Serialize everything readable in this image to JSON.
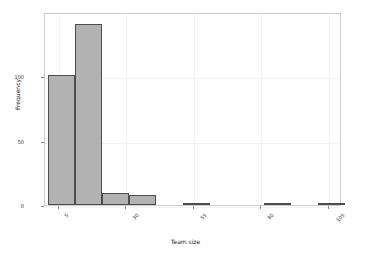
{
  "chart_data": {
    "type": "bar",
    "title": "",
    "xlabel": "Team size",
    "ylabel": "Frequency",
    "grid": true,
    "legend": null,
    "xlim": [
      0,
      110
    ],
    "ylim": [
      0,
      150
    ],
    "yticks": [
      0,
      50,
      100
    ],
    "ytick_labels": [
      "0",
      "50",
      "100"
    ],
    "xticks": [
      5,
      30,
      55,
      80,
      105
    ],
    "xtick_labels": [
      "5",
      "30",
      "55",
      "80",
      "105"
    ],
    "xtick_rotation": -45,
    "bin_edges": [
      1,
      11,
      21,
      31,
      41,
      51,
      61,
      71,
      81,
      91,
      101,
      111
    ],
    "categories": [
      "1-11",
      "11-21",
      "21-31",
      "31-41",
      "41-51",
      "51-61",
      "61-71",
      "71-81",
      "81-91",
      "91-101",
      "101-111"
    ],
    "values": [
      101,
      141,
      9,
      8,
      0,
      1,
      0,
      0,
      1,
      0,
      1
    ],
    "bar_fill_color": "#b2b2b2",
    "bar_edge_color": "#4d4d4d",
    "background_color": "#ffffff",
    "axes_edge_color": "#cccccc",
    "grid_color": "#f2f2f2"
  }
}
